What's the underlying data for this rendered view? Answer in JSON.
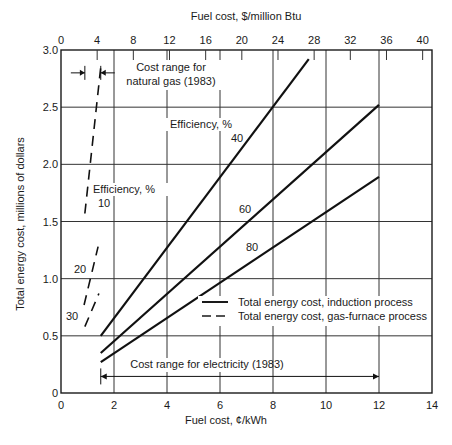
{
  "chart_data": {
    "type": "line",
    "title": "",
    "xlabel": "Fuel cost, ¢/kWh",
    "x2label": "Fuel cost, $/million Btu",
    "ylabel": "Total energy cost, millions of dollars",
    "xlim": [
      0,
      14
    ],
    "ylim": [
      0,
      3.0
    ],
    "x_ticks": [
      0,
      2,
      4,
      6,
      8,
      10,
      12,
      14
    ],
    "x_tick_labels": [
      "0",
      "2",
      "4",
      "6",
      "8",
      "10",
      "12",
      "14"
    ],
    "y_ticks": [
      0,
      0.5,
      1.0,
      1.5,
      2.0,
      2.5,
      3.0
    ],
    "y_tick_labels": [
      "0",
      "0.5",
      "1.0",
      "1.5",
      "2.0",
      "2.5",
      "3.0"
    ],
    "x2_ticks_per_million_btu": [
      0,
      4,
      8,
      12,
      16,
      20,
      24,
      28,
      32,
      36,
      40
    ],
    "x2_tick_labels": [
      "0",
      "4",
      "8",
      "12",
      "16",
      "20",
      "24",
      "28",
      "32",
      "36",
      "40"
    ],
    "grid": true,
    "series": [
      {
        "name": "Induction 40%",
        "group": "induction",
        "label": "40",
        "style": "solid",
        "points": [
          [
            1.5,
            0.5
          ],
          [
            9.35,
            2.92
          ]
        ]
      },
      {
        "name": "Induction 60%",
        "group": "induction",
        "label": "60",
        "style": "solid",
        "points": [
          [
            1.5,
            0.35
          ],
          [
            12.0,
            2.52
          ]
        ]
      },
      {
        "name": "Induction 80%",
        "group": "induction",
        "label": "80",
        "style": "solid",
        "points": [
          [
            1.5,
            0.27
          ],
          [
            12.0,
            1.89
          ]
        ]
      },
      {
        "name": "Gas furnace 10%",
        "group": "gas",
        "label": "10",
        "style": "dashed",
        "points": [
          [
            0.9,
            1.57
          ],
          [
            1.5,
            2.85
          ]
        ]
      },
      {
        "name": "Gas furnace 20%",
        "group": "gas",
        "label": "20",
        "style": "dashed",
        "points": [
          [
            0.87,
            0.77
          ],
          [
            1.4,
            1.28
          ]
        ]
      },
      {
        "name": "Gas furnace 30%",
        "group": "gas",
        "label": "30",
        "style": "dashed",
        "points": [
          [
            0.9,
            0.58
          ],
          [
            1.43,
            0.87
          ]
        ]
      }
    ],
    "legend": {
      "position": "lower-right",
      "entries": [
        {
          "style": "solid",
          "label": "Total energy cost, induction process"
        },
        {
          "style": "dashed",
          "label": "Total energy cost, gas-furnace process"
        }
      ]
    },
    "annotations": {
      "efficiency_label": "Efficiency, %",
      "gas_range_line1": "Cost range for",
      "gas_range_line2": "natural gas (1983)",
      "gas_range_x": [
        0.9,
        1.5
      ],
      "gas_range_y": 2.8,
      "electricity_range": "Cost range for electricity (1983)",
      "electricity_range_x": [
        1.5,
        12.0
      ],
      "electricity_range_y": 0.25
    }
  }
}
